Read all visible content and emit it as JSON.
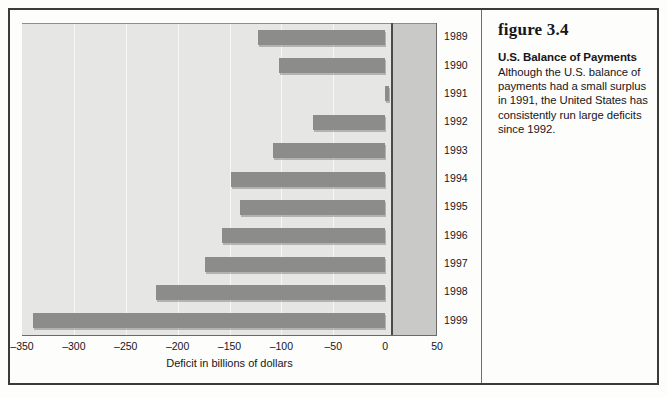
{
  "figure": {
    "number_label": "figure 3.4",
    "title": "U.S. Balance of Payments",
    "body": "Although the U.S. balance of payments had a small surplus in 1991, the United States has consistently run large deficits since 1992."
  },
  "chart_data": {
    "type": "bar",
    "orientation": "horizontal",
    "title": "U.S. Balance of Payments",
    "xlabel": "Deficit in billions of dollars",
    "ylabel": "",
    "xlim": [
      -350,
      50
    ],
    "xticks": [
      "–350",
      "–300",
      "–250",
      "–200",
      "–150",
      "–100",
      "–50",
      "0",
      "50"
    ],
    "xtick_values": [
      -350,
      -300,
      -250,
      -200,
      -150,
      -100,
      -50,
      0,
      50
    ],
    "grid": true,
    "legend": "none",
    "categories": [
      "1989",
      "1990",
      "1991",
      "1992",
      "1993",
      "1994",
      "1995",
      "1996",
      "1997",
      "1998",
      "1999"
    ],
    "values": [
      -123,
      -102,
      4,
      -70,
      -108,
      -149,
      -140,
      -157,
      -174,
      -221,
      -339
    ],
    "bar_color": "#8c8c8a",
    "plot_background_negative": "#e6e6e4",
    "plot_background_positive": "#c9c9c7"
  }
}
